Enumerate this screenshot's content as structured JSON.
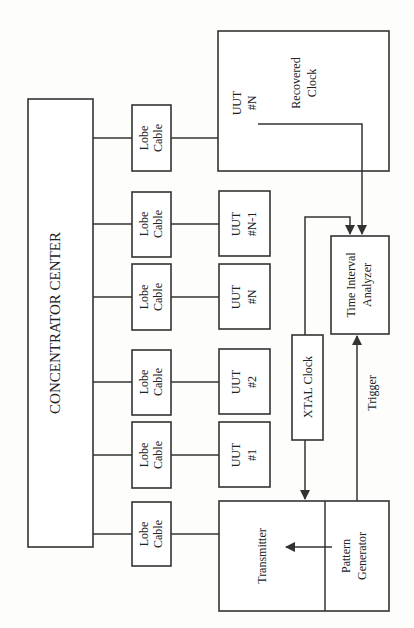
{
  "diagram": {
    "type": "block-diagram",
    "orientation": "rotated-90-ccw",
    "concentrator": {
      "label": "CONCENTRATOR CENTER"
    },
    "lobe_cables": [
      {
        "line1": "Lobe",
        "line2": "Cable"
      },
      {
        "line1": "Lobe",
        "line2": "Cable"
      },
      {
        "line1": "Lobe",
        "line2": "Cable"
      },
      {
        "line1": "Lobe",
        "line2": "Cable"
      },
      {
        "line1": "Lobe",
        "line2": "Cable"
      },
      {
        "line1": "Lobe",
        "line2": "Cable"
      }
    ],
    "uuts": [
      {
        "line1": "UUT",
        "line2": "#N-1"
      },
      {
        "line1": "UUT",
        "line2": "#N"
      },
      {
        "line1": "UUT",
        "line2": "#2"
      },
      {
        "line1": "UUT",
        "line2": "#1"
      }
    ],
    "measured_uut": {
      "line1": "UUT",
      "line2": "#N",
      "signal_line1": "Recovered",
      "signal_line2": "Clock"
    },
    "analyzer": {
      "line1": "Time Interval",
      "line2": "Analyzer"
    },
    "xtal": {
      "label": "XTAL Clock"
    },
    "trigger": {
      "label": "Trigger"
    },
    "transmitter": {
      "label": "Transmitter"
    },
    "pattern_generator": {
      "line1": "Pattern",
      "line2": "Generator"
    }
  }
}
